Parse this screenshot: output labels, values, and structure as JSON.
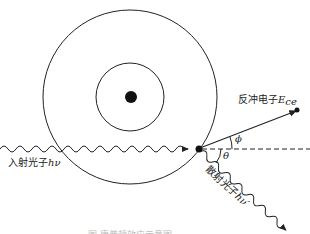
{
  "diagram": {
    "labels": {
      "incident_photon": "入射光子",
      "incident_photon_symbol": "hν",
      "recoil_electron": "反冲电子",
      "recoil_electron_symbol": "E",
      "recoil_electron_subscript": "ce",
      "scattered_photon": "散射光子",
      "scattered_photon_symbol": "hν′",
      "angle_phi": "ϕ",
      "angle_theta": "θ"
    },
    "caption": "图     康普顿效应示意图",
    "colors": {
      "line": "#222222",
      "background": "#ffffff"
    }
  }
}
